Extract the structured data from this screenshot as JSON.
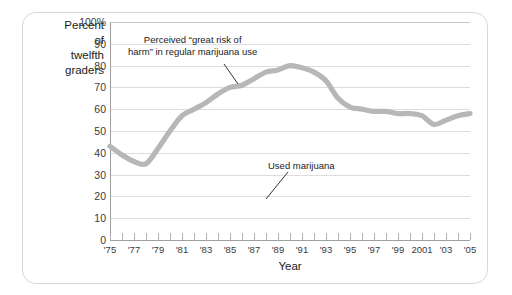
{
  "axis": {
    "y_caption_lines": [
      "Percent",
      "of",
      "twelfth",
      "graders"
    ],
    "x_title": "Year",
    "y_ticks": [
      "100%",
      "90",
      "80",
      "70",
      "60",
      "50",
      "40",
      "30",
      "20",
      "10",
      "0"
    ],
    "x_ticks": [
      "'75",
      "'77",
      "'79",
      "'81",
      "'83",
      "'85",
      "'87",
      "'89",
      "'91",
      "'93",
      "'95",
      "'97",
      "'99",
      "2001",
      "'03",
      "'05"
    ]
  },
  "annotations": {
    "risk_line1": "Perceived “great risk of",
    "risk_line2": "harm” in regular marijuana use",
    "used": "Used marijuana"
  },
  "colors": {
    "series": "#b7b7b7",
    "grid": "#dddddd",
    "axis": "#9f9f9f",
    "text": "#1b1b1b",
    "card_border": "#d8d8d8"
  },
  "chart_data": {
    "type": "line",
    "title": "",
    "xlabel": "Year",
    "ylabel": "Percent of twelfth graders",
    "ylim": [
      0,
      100
    ],
    "xlim": [
      1975,
      2005
    ],
    "grid": true,
    "legend": "none (inline annotations)",
    "x": [
      1975,
      1976,
      1977,
      1978,
      1979,
      1980,
      1981,
      1982,
      1983,
      1984,
      1985,
      1986,
      1987,
      1988,
      1989,
      1990,
      1991,
      1992,
      1993,
      1994,
      1995,
      1996,
      1997,
      1998,
      1999,
      2000,
      2001,
      2002,
      2003,
      2004,
      2005
    ],
    "series": [
      {
        "name": "Perceived “great risk of harm” in regular marijuana use",
        "values": [
          43,
          39,
          36,
          35,
          42,
          50,
          57,
          60,
          63,
          67,
          70,
          71,
          74,
          77,
          78,
          80,
          79,
          77,
          73,
          65,
          61,
          60,
          59,
          59,
          58,
          58,
          57,
          53,
          55,
          57,
          58
        ]
      }
    ],
    "annotations": [
      {
        "text": "Perceived “great risk of harm” in regular marijuana use",
        "points_to_year": 1986,
        "points_to_value": 71
      },
      {
        "text": "Used marijuana",
        "points_to_year": 1990,
        "points_to_value": 20
      }
    ]
  }
}
